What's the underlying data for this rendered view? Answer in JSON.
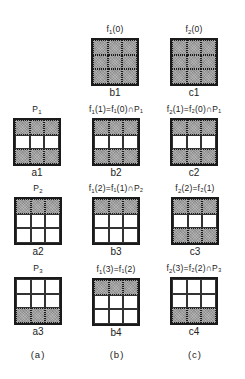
{
  "figure": {
    "column_labels": [
      "(a)",
      "(b)",
      "(c)"
    ],
    "grids": [
      {
        "id": "b1",
        "caption": "f1(0)",
        "label": "b1",
        "x": 91,
        "y": 38,
        "cells": [
          1,
          1,
          1,
          1,
          1,
          1,
          1,
          1,
          1
        ]
      },
      {
        "id": "c1",
        "caption": "f2(0)",
        "label": "c1",
        "x": 170,
        "y": 38,
        "cells": [
          1,
          1,
          1,
          1,
          1,
          1,
          1,
          1,
          1
        ]
      },
      {
        "id": "a1",
        "caption": "P1",
        "label": "a1",
        "x": 13,
        "y": 118,
        "cells": [
          1,
          1,
          1,
          0,
          0,
          0,
          1,
          1,
          1
        ]
      },
      {
        "id": "b2",
        "caption": "f1(1)=f1(0)∩P1",
        "label": "b2",
        "x": 92,
        "y": 118,
        "cells": [
          1,
          1,
          1,
          0,
          0,
          0,
          1,
          1,
          1
        ]
      },
      {
        "id": "c2",
        "caption": "f2(1)=f2(0)∩P1",
        "label": "c2",
        "x": 170,
        "y": 118,
        "cells": [
          1,
          1,
          1,
          0,
          0,
          0,
          1,
          1,
          1
        ]
      },
      {
        "id": "a2",
        "caption": "P2",
        "label": "a2",
        "x": 14,
        "y": 197,
        "cells": [
          1,
          1,
          1,
          0,
          0,
          0,
          0,
          0,
          0
        ]
      },
      {
        "id": "b3",
        "caption": "f1(2)=f1(1)∩P2",
        "label": "b3",
        "x": 92,
        "y": 197,
        "cells": [
          1,
          1,
          1,
          0,
          0,
          0,
          0,
          0,
          0
        ]
      },
      {
        "id": "c3",
        "caption": "f2(2)=f2(1)",
        "label": "c3",
        "x": 171,
        "y": 197,
        "cells": [
          1,
          1,
          1,
          0,
          0,
          0,
          1,
          1,
          1
        ]
      },
      {
        "id": "a3",
        "caption": "P3",
        "label": "a3",
        "x": 14,
        "y": 277,
        "cells": [
          0,
          0,
          0,
          0,
          0,
          0,
          1,
          1,
          1
        ]
      },
      {
        "id": "b4",
        "caption": "f1(3)=f1(2)",
        "label": "b4",
        "x": 92,
        "y": 278,
        "cells": [
          1,
          1,
          1,
          0,
          0,
          0,
          0,
          0,
          0
        ]
      },
      {
        "id": "c4",
        "caption": "f2(3)=f2(2)∩P3",
        "label": "c4",
        "x": 170,
        "y": 277,
        "cells": [
          0,
          0,
          0,
          0,
          0,
          0,
          1,
          1,
          1
        ]
      }
    ]
  },
  "captions": {
    "b1": {
      "f": "f",
      "s": "1",
      "rest": "(0)"
    },
    "c1": {
      "f": "f",
      "s": "2",
      "rest": "(0)"
    },
    "a1": {
      "f": "P",
      "s": "1",
      "rest": ""
    },
    "b2": {
      "f": "f",
      "s": "1",
      "rest": "(1)=f₁(0)∩P₁"
    },
    "c2": {
      "f": "f",
      "s": "2",
      "rest": "(1)=f₂(0)∩P₁"
    },
    "a2": {
      "f": "P",
      "s": "2",
      "rest": ""
    },
    "b3": {
      "f": "f",
      "s": "1",
      "rest": "(2)=f₁(1)∩P₂"
    },
    "c3": {
      "f": "f",
      "s": "2",
      "rest": "(2)=f₂(1)"
    },
    "a3": {
      "f": "P",
      "s": "3",
      "rest": ""
    },
    "b4": {
      "f": "f",
      "s": "1",
      "rest": "(3)=f₁(2)"
    },
    "c4": {
      "f": "f",
      "s": "2",
      "rest": "(3)=f₂(2)∩P₃"
    }
  },
  "colors": {
    "shaded": "#b3b3b3",
    "border": "#1a1a1a",
    "background": "#ffffff"
  }
}
